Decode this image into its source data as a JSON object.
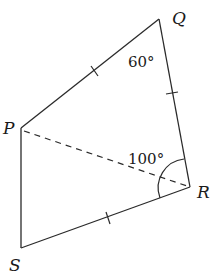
{
  "diagram": {
    "type": "quadrilateral",
    "vertices": {
      "P": {
        "label": "P",
        "x": 21,
        "y": 128
      },
      "Q": {
        "label": "Q",
        "x": 159,
        "y": 19
      },
      "R": {
        "label": "R",
        "x": 190,
        "y": 187
      },
      "S": {
        "label": "S",
        "x": 21,
        "y": 248
      }
    },
    "edges": [
      {
        "from": "P",
        "to": "Q",
        "style": "solid",
        "tick_marks": 1
      },
      {
        "from": "Q",
        "to": "R",
        "style": "solid",
        "tick_marks": 1
      },
      {
        "from": "R",
        "to": "S",
        "style": "solid",
        "tick_marks": 1
      },
      {
        "from": "S",
        "to": "P",
        "style": "solid",
        "tick_marks": 0
      }
    ],
    "diagonals": [
      {
        "from": "P",
        "to": "R",
        "style": "dashed"
      }
    ],
    "angles": [
      {
        "vertex": "Q",
        "label": "60°"
      },
      {
        "vertex": "R",
        "label": "100°",
        "arc": true
      }
    ]
  }
}
